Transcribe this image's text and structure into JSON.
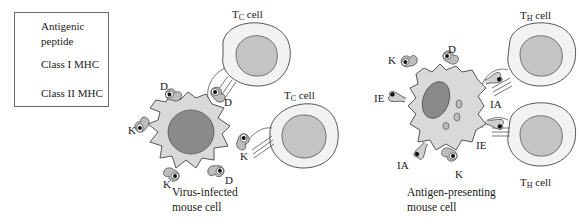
{
  "legend": {
    "items": [
      {
        "icon": "antigenic-peptide-icon",
        "label_line1": "Antigenic",
        "label_line2": "peptide"
      },
      {
        "icon": "class-i-mhc-icon",
        "label": "Class I MHC"
      },
      {
        "icon": "class-ii-mhc-icon",
        "label": "Class II MHC"
      }
    ]
  },
  "left_panel": {
    "caption_line1": "Virus-infected",
    "caption_line2": "mouse cell",
    "tc_cell_top": {
      "main": "T",
      "sub": "C",
      "rest": " cell"
    },
    "tc_cell_right": {
      "main": "T",
      "sub": "C",
      "rest": " cell"
    },
    "mhc_labels": [
      "D",
      "D",
      "K",
      "K",
      "K",
      "D"
    ]
  },
  "right_panel": {
    "caption_line1": "Antigen-presenting",
    "caption_line2": "mouse cell",
    "th_cell_top": {
      "main": "T",
      "sub": "H",
      "rest": " cell"
    },
    "th_cell_bottom": {
      "main": "T",
      "sub": "H",
      "rest": " cell"
    },
    "mhc_labels": [
      "K",
      "D",
      "IE",
      "IA",
      "IA",
      "IE",
      "K"
    ]
  },
  "colors": {
    "cell_fill": "#d9d9d9",
    "nucleus_fill": "#8a8a8a",
    "tcell_fill": "#f2f2f2",
    "tcell_nucleus": "#c4c4c4",
    "outline": "#555555",
    "peptide": "#111111"
  }
}
